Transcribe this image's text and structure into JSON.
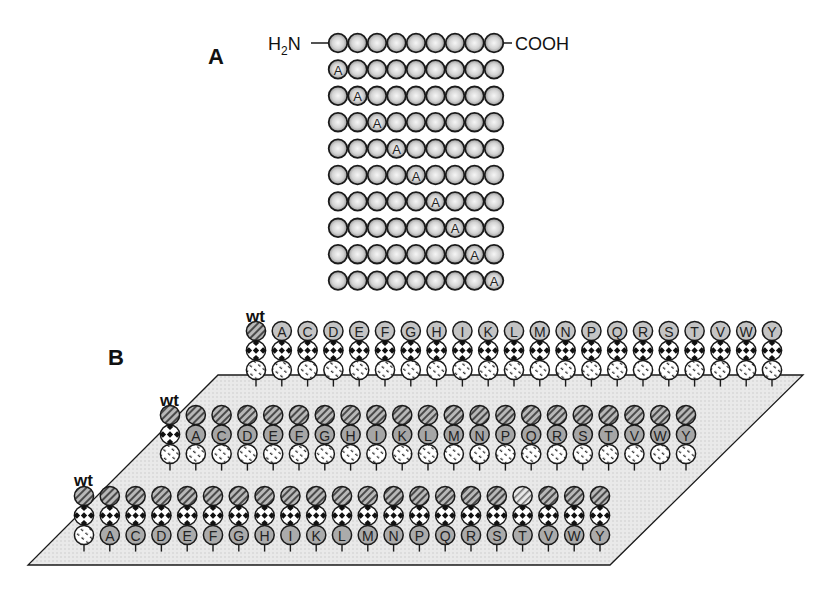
{
  "panel_a": {
    "label": "A",
    "n_terminus": "H",
    "n_terminus_sub": "2",
    "n_terminus_suffix": "N",
    "c_terminus": "COOH",
    "residues_per_row": 9,
    "wild_type_row": {
      "substitution_position": null
    },
    "scan_rows": [
      {
        "substitution_position": 1,
        "letter": "A"
      },
      {
        "substitution_position": 2,
        "letter": "A"
      },
      {
        "substitution_position": 3,
        "letter": "A"
      },
      {
        "substitution_position": 4,
        "letter": "A"
      },
      {
        "substitution_position": 5,
        "letter": "A"
      },
      {
        "substitution_position": 6,
        "letter": "A"
      },
      {
        "substitution_position": 7,
        "letter": "A"
      },
      {
        "substitution_position": 8,
        "letter": "A"
      },
      {
        "substitution_position": 9,
        "letter": "A"
      }
    ]
  },
  "panel_b": {
    "label": "B",
    "wt_label": "wt",
    "amino_acids": [
      "A",
      "C",
      "D",
      "E",
      "F",
      "G",
      "H",
      "I",
      "K",
      "L",
      "M",
      "N",
      "P",
      "Q",
      "R",
      "S",
      "T",
      "V",
      "W",
      "Y"
    ],
    "rows": [
      {
        "name": "row-1-substitution-top",
        "varied_position": "top",
        "wt_label": "wt"
      },
      {
        "name": "row-2-substitution-middle",
        "varied_position": "middle",
        "wt_label": "wt"
      },
      {
        "name": "row-3-substitution-bottom",
        "varied_position": "bottom",
        "wt_label": "wt",
        "light_top_column": "T"
      }
    ]
  },
  "colors": {
    "background": "#ffffff",
    "plane_fill": "#e6e6e6",
    "stroke": "#1a1a1a",
    "bead_highlight": "#f4f4f4",
    "bead_shadow": "#8a8a8a",
    "substituted_fill": "#a9a9a9",
    "substituted_fill_light": "#c8c8c8",
    "hatched_dark": "#9a9a9a"
  }
}
